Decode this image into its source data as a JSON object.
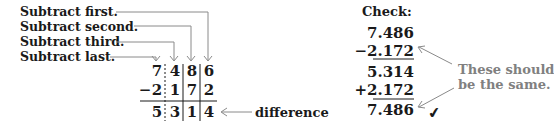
{
  "labels": {
    "first": "Subtract first.",
    "second": "Subtract second.",
    "third": "Subtract third.",
    "last": "Subtract last."
  },
  "problem": {
    "top": [
      "7",
      "4",
      "8",
      "6"
    ],
    "bottom_sign": "−",
    "bottom": [
      "2",
      "1",
      "7",
      "2"
    ],
    "result": [
      "5",
      "3",
      "1",
      "4"
    ],
    "decimal_marker": ":",
    "difference_label": "difference"
  },
  "check": {
    "title": "Check:",
    "lines": [
      "7.486",
      "−2.172",
      "5.314",
      "+2.172",
      "7.486"
    ],
    "note_line1": "These should",
    "note_line2": "be the same.",
    "checkmark": "✔"
  },
  "colors": {
    "text": "#1a1a1a",
    "arrow": "#8a8a8a",
    "note": "#808080"
  }
}
